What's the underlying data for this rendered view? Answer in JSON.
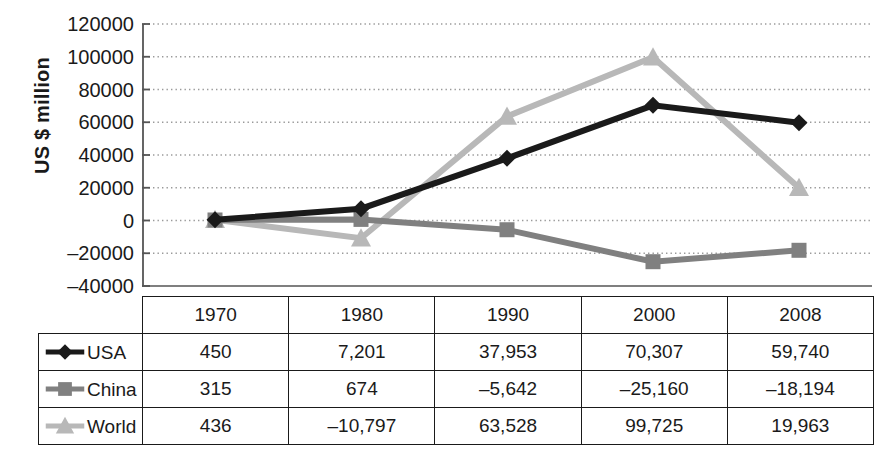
{
  "chart_data": {
    "type": "line",
    "title": "",
    "xlabel": "",
    "ylabel": "US $ million",
    "categories": [
      "1970",
      "1980",
      "1990",
      "2000",
      "2008"
    ],
    "ylim": [
      -40000,
      120000
    ],
    "ytick_step": 20000,
    "yticks": [
      "120000",
      "100000",
      "80000",
      "60000",
      "40000",
      "20000",
      "0",
      "–20000",
      "–40000"
    ],
    "grid": "horizontal-dotted",
    "legend_position": "row-header-table",
    "series": [
      {
        "name": "USA",
        "color": "#1a1a1a",
        "marker": "diamond",
        "values": [
          450,
          7201,
          37953,
          70307,
          59740
        ],
        "labels": [
          "450",
          "7,201",
          "37,953",
          "70,307",
          "59,740"
        ]
      },
      {
        "name": "China",
        "color": "#808080",
        "marker": "square",
        "values": [
          315,
          674,
          -5642,
          -25160,
          -18194
        ],
        "labels": [
          "315",
          "674",
          "–5,642",
          "–25,160",
          "–18,194"
        ]
      },
      {
        "name": "World",
        "color": "#b8b8b8",
        "marker": "triangle",
        "values": [
          436,
          -10797,
          63528,
          99725,
          19963
        ],
        "labels": [
          "436",
          "–10,797",
          "63,528",
          "99,725",
          "19,963"
        ]
      }
    ]
  },
  "table": {
    "corner_label": "",
    "column_headers": [
      "1970",
      "1980",
      "1990",
      "2000",
      "2008"
    ],
    "rows": [
      {
        "label": "USA",
        "marker": "diamond",
        "color": "#1a1a1a",
        "cells": [
          "450",
          "7,201",
          "37,953",
          "70,307",
          "59,740"
        ]
      },
      {
        "label": "China",
        "marker": "square",
        "color": "#808080",
        "cells": [
          "315",
          "674",
          "–5,642",
          "–25,160",
          "–18,194"
        ]
      },
      {
        "label": "World",
        "marker": "triangle",
        "color": "#b8b8b8",
        "cells": [
          "436",
          "–10,797",
          "63,528",
          "99,725",
          "19,963"
        ]
      }
    ]
  },
  "colors": {
    "usa": "#1a1a1a",
    "china": "#808080",
    "world": "#b8b8b8",
    "axis": "#555555",
    "grid": "#9a9a9a",
    "border": "#1a1a1a",
    "background": "#ffffff"
  }
}
